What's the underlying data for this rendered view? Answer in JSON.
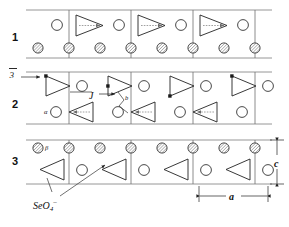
{
  "figure": {
    "background_color": "#ffffff",
    "line_color": "#6f6f6f"
  },
  "rows": [
    {
      "id": "row-1",
      "label": "1",
      "top_y": 10,
      "bottom_y": 58,
      "triangle_direction": "right",
      "triangle_row": "top",
      "circle_row": "top",
      "hatched_row": "bottom"
    },
    {
      "id": "row-2",
      "label": "2",
      "top_y": 72,
      "bottom_y": 124,
      "triangle_direction": "alternating",
      "triangle_row": "both",
      "circle_row": "both",
      "hatched_row": "none"
    },
    {
      "id": "row-3",
      "label": "3",
      "top_y": 140,
      "bottom_y": 184,
      "triangle_direction": "left",
      "triangle_row": "bottom",
      "circle_row": "bottom",
      "hatched_row": "top"
    }
  ],
  "annotations": {
    "axis_symbol": "3",
    "axis_symbol_overbar": true,
    "axis_note": "bar-3 axis direction arrow",
    "glide_label": "J",
    "alpha_label": "α",
    "beta_label": "β",
    "marker_label": "b",
    "formula": {
      "element": "SeO",
      "subscript": "4",
      "superscript": "–"
    }
  },
  "dimensions": {
    "a": {
      "label": "a",
      "orientation": "horizontal",
      "x_start": 199,
      "x_end": 268,
      "y": 196
    },
    "c": {
      "label": "c",
      "orientation": "vertical",
      "y_start": 140,
      "y_end": 184,
      "x": 277
    }
  },
  "colors": {
    "cell_line": "#6f6f6f",
    "shape_outline": "#222222",
    "hatch_fill": "#9a9a9a",
    "dashed_arrow": "#888888",
    "text": "#111111"
  },
  "icons": {
    "triangle": "tetrahedron-triangle-icon",
    "open_circle": "open-circle-site-icon",
    "hatched_circle": "hatched-circle-site-icon",
    "arrow": "direction-arrow-icon"
  }
}
